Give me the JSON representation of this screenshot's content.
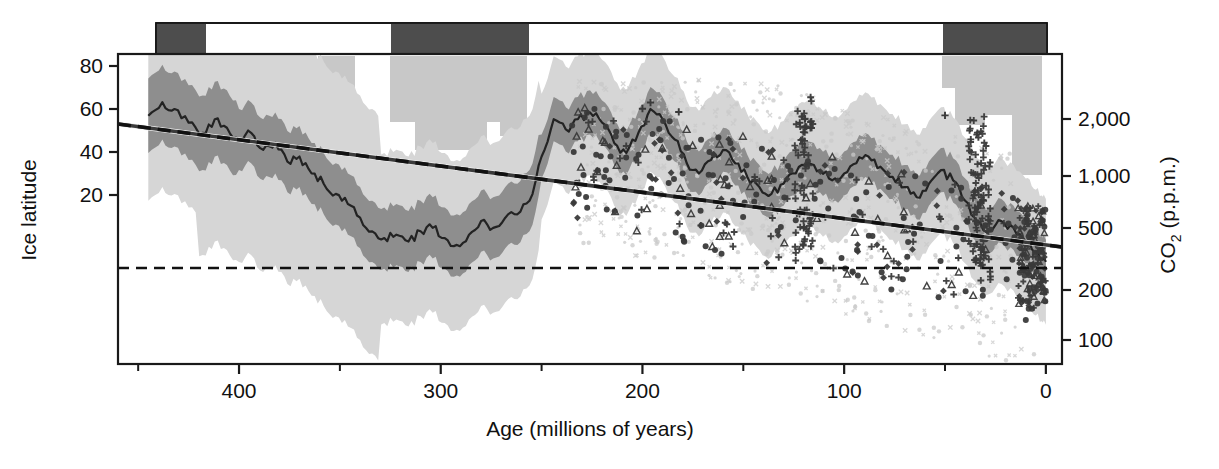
{
  "chart_data": {
    "type": "line",
    "title": "",
    "xlabel": "Age (millions of years)",
    "ylabel_left": "Ice latitude",
    "ylabel_right_main": "CO",
    "ylabel_right_sub": "2",
    "ylabel_right_tail": " (p.p.m.)",
    "xlim": [
      460,
      -8
    ],
    "x_major_ticks": [
      400,
      300,
      200,
      100,
      0
    ],
    "x_major_tick_labels": [
      "400",
      "300",
      "200",
      "100",
      "0"
    ],
    "x_minor_ticks": [
      450,
      350,
      250,
      150,
      50
    ],
    "left_axis": {
      "label": "Ice latitude",
      "ticks": [
        80,
        60,
        40,
        20
      ],
      "tick_labels": [
        "80",
        "60",
        "40",
        "20"
      ],
      "ylim": [
        -63,
        94
      ],
      "pixel_anchor_top": {
        "value": 80,
        "y": 66
      },
      "pixel_anchor_bot": {
        "value": 20,
        "y": 195
      }
    },
    "right_axis": {
      "label": "CO2 (p.p.m.)",
      "scale": "log",
      "ticks": [
        2000,
        1000,
        500,
        200,
        100
      ],
      "tick_labels": [
        "2,000",
        "1,000",
        "500",
        "200",
        "100"
      ],
      "tick_pixels": [
        119,
        176,
        228,
        290,
        340
      ]
    },
    "reference_line": {
      "name": "pre-industrial CO2",
      "value_ppm": 280,
      "style": "dashed",
      "y_pixel": 268
    },
    "glaciation_bar": {
      "name": "icehouse-greenhouse bar",
      "color_icehouse": "#4d4d4d",
      "color_greenhouse": "#ffffff",
      "segments": [
        {
          "state": "icehouse",
          "x_start_px": 156,
          "x_end_px": 206
        },
        {
          "state": "greenhouse",
          "x_start_px": 206,
          "x_end_px": 391
        },
        {
          "state": "icehouse",
          "x_start_px": 391,
          "x_end_px": 529
        },
        {
          "state": "greenhouse",
          "x_start_px": 529,
          "x_end_px": 943
        },
        {
          "state": "icehouse",
          "x_start_px": 943,
          "x_end_px": 1047
        }
      ]
    },
    "paleolatitude_blocks": {
      "name": "glacial deposit latitude blocks",
      "color": "#c8c8c8",
      "rects_px": [
        {
          "x": 157,
          "y": 56,
          "w": 23,
          "h": 45
        },
        {
          "x": 157,
          "y": 101,
          "w": 56,
          "h": 46
        },
        {
          "x": 318,
          "y": 56,
          "w": 37,
          "h": 50
        },
        {
          "x": 390,
          "y": 56,
          "w": 137,
          "h": 66
        },
        {
          "x": 415,
          "y": 122,
          "w": 72,
          "h": 28
        },
        {
          "x": 500,
          "y": 122,
          "w": 27,
          "h": 14
        },
        {
          "x": 942,
          "y": 56,
          "w": 100,
          "h": 32
        },
        {
          "x": 955,
          "y": 88,
          "w": 57,
          "h": 27
        },
        {
          "x": 955,
          "y": 115,
          "w": 30,
          "h": 10
        },
        {
          "x": 1012,
          "y": 88,
          "w": 30,
          "h": 87
        }
      ]
    },
    "bands": {
      "outer_name": "95% confidence band",
      "outer_color": "#d4d4d4",
      "inner_name": "68% confidence band",
      "inner_color": "#8e8e8e"
    },
    "median_line": {
      "name": "median CO2 reconstruction",
      "color": "#222222",
      "width": 2.2
    },
    "trend_line": {
      "name": "long-term CO2 trend",
      "color": "#151515",
      "style": "dashed",
      "width": 3.4,
      "y_start_px": 124,
      "y_end_px": 247
    },
    "proxy_markers": {
      "types": [
        "circle",
        "cross",
        "triangle",
        "diamond",
        "x"
      ],
      "color_dark": "#3a3a3a",
      "color_light": "#c9c9c9"
    },
    "series_note": "Ice latitude (left axis) and CO2 in p.p.m. on log right axis versus geologic age"
  },
  "axes": {
    "left_title": "Ice latitude",
    "bottom_title": "Age (millions of years)",
    "right_title_main": "CO",
    "right_title_sub": "2",
    "right_title_rest": " (p.p.m.)"
  }
}
